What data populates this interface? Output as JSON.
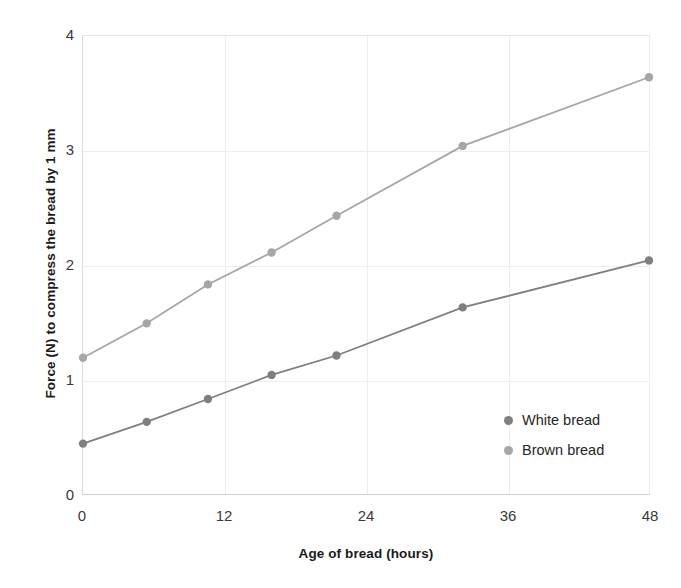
{
  "chart_data": {
    "type": "line",
    "title": "",
    "xlabel": "Age of bread (hours)",
    "ylabel": "Force (N) to compress the bread by 1 mm",
    "xlim": [
      0,
      48
    ],
    "ylim": [
      0,
      4
    ],
    "xticks": [
      "0",
      "12",
      "24",
      "36",
      "48"
    ],
    "xtick_values": [
      0,
      12,
      24,
      36,
      48
    ],
    "yticks": [
      "0",
      "1",
      "2",
      "3",
      "4"
    ],
    "ytick_values": [
      0,
      1,
      2,
      3,
      4
    ],
    "grid": true,
    "legend_position": "inside-right",
    "series": [
      {
        "name": "White bread",
        "color": "#7f7f7f",
        "marker": "circle",
        "points": [
          {
            "x": 0.0,
            "y": 0.44
          },
          {
            "x": 5.4,
            "y": 0.63
          },
          {
            "x": 10.6,
            "y": 0.83
          },
          {
            "x": 16.0,
            "y": 1.04
          },
          {
            "x": 21.5,
            "y": 1.21
          },
          {
            "x": 32.2,
            "y": 1.63
          },
          {
            "x": 48.0,
            "y": 2.04
          }
        ]
      },
      {
        "name": "Brown bread",
        "color": "#a6a6a6",
        "marker": "circle",
        "points": [
          {
            "x": 0.0,
            "y": 1.19
          },
          {
            "x": 5.4,
            "y": 1.49
          },
          {
            "x": 10.6,
            "y": 1.83
          },
          {
            "x": 16.0,
            "y": 2.11
          },
          {
            "x": 21.5,
            "y": 2.43
          },
          {
            "x": 32.2,
            "y": 3.04
          },
          {
            "x": 48.0,
            "y": 3.64
          }
        ]
      }
    ]
  },
  "legend": {
    "items": [
      {
        "label": "White bread",
        "color": "#7f7f7f"
      },
      {
        "label": "Brown bread",
        "color": "#a6a6a6"
      }
    ]
  },
  "colors": {
    "white_bread": "#7f7f7f",
    "brown_bread": "#a6a6a6",
    "gridline": "#ededed",
    "axis": "#d0d0d0",
    "text": "#1a1a1a"
  }
}
